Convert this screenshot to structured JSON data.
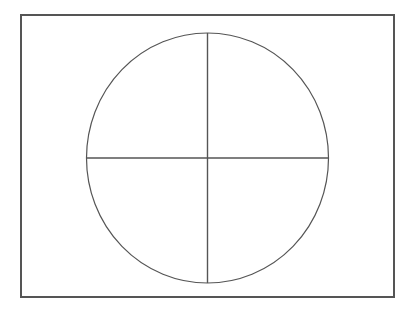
{
  "figure": {
    "background_color": "#ffffff",
    "stroke_color": "#555555",
    "stroke_width": "1.3",
    "canvas": {
      "width": 414,
      "height": 318
    },
    "frame": {
      "name": "Outer rectangle",
      "x": 21,
      "y": 15,
      "width": 373,
      "height": 282,
      "fill": "none",
      "stroke_color": "#555555",
      "stroke_width": "1.6"
    },
    "circle": {
      "name": "Circle",
      "center_x": 207.5,
      "center_y": 158,
      "radius_x": 121,
      "radius_y": 125,
      "fill": "none",
      "stroke_color": "#555555",
      "stroke_width": "1.2"
    },
    "vertical_diameter": {
      "name": "Vertical diameter",
      "x1": 207.5,
      "y1": 33,
      "x2": 207.5,
      "y2": 283,
      "stroke_color": "#555555",
      "stroke_width": "1.4"
    },
    "horizontal_diameter": {
      "name": "Horizontal diameter",
      "x1": 86.5,
      "y1": 158,
      "x2": 328.5,
      "y2": 158,
      "stroke_color": "#555555",
      "stroke_width": "1.4"
    },
    "labels": []
  },
  "chart_data": {
    "type": "diagram",
    "shapes": [
      {
        "kind": "rectangle",
        "label": "outer-frame",
        "x": 21,
        "y": 15,
        "width": 373,
        "height": 282,
        "stroke": "#555555",
        "fill": "none"
      },
      {
        "kind": "ellipse",
        "label": "circle",
        "cx": 207.5,
        "cy": 158,
        "rx": 121,
        "ry": 125,
        "stroke": "#555555",
        "fill": "none"
      },
      {
        "kind": "line",
        "label": "vertical-diameter",
        "x1": 207.5,
        "y1": 33,
        "x2": 207.5,
        "y2": 283,
        "stroke": "#555555"
      },
      {
        "kind": "line",
        "label": "horizontal-diameter",
        "x1": 86.5,
        "y1": 158,
        "x2": 328.5,
        "y2": 158,
        "stroke": "#555555"
      }
    ],
    "quadrant_count": 4,
    "xlabel": "",
    "ylabel": "",
    "grid": false,
    "legend": false
  }
}
